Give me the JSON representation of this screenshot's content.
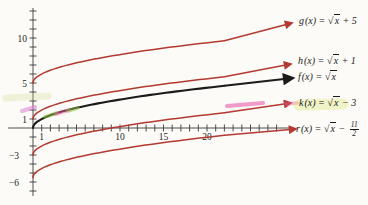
{
  "figure": {
    "background": "#fcfbf7",
    "axis_color": "#3a3a3a",
    "red_curve_color": "#b23a32",
    "black_curve_color": "#1b1b1b"
  },
  "chart_data": {
    "type": "line",
    "description_of_content": "Graphs of the square-root function and four vertical translations, each curve ending in an arrow pointing to its equation label",
    "grid": false,
    "x_axis": {
      "min": 0,
      "max": 28,
      "tick_interval": 1,
      "tick_label_values": [
        1,
        10,
        15,
        20
      ],
      "tick_labels": [
        "1",
        "10",
        "15",
        "20"
      ]
    },
    "y_axis": {
      "min": -7,
      "max": 13,
      "tick_interval": 1,
      "tick_label_values": [
        10,
        5,
        1,
        -3,
        -6
      ],
      "tick_labels": [
        "10",
        "5",
        "1",
        "−3",
        "−6"
      ]
    },
    "series": [
      {
        "name": "g",
        "expression": "g(x) = √x + 5",
        "vertical_shift": 5,
        "y_intercept": 5,
        "color": "#b23a32",
        "label_parts": {
          "name": "g",
          "mid": "(x) = ",
          "radicand": "x",
          "tail": " + 5"
        }
      },
      {
        "name": "h",
        "expression": "h(x) = √x + 1",
        "vertical_shift": 1,
        "y_intercept": 1,
        "color": "#b23a32",
        "label_parts": {
          "name": "h",
          "mid": "(x) = ",
          "radicand": "x",
          "tail": " + 1"
        }
      },
      {
        "name": "f",
        "expression": "f(x) = √x",
        "vertical_shift": 0,
        "y_intercept": 0,
        "color": "#1b1b1b",
        "label_parts": {
          "name": "f",
          "mid": "(x) = ",
          "radicand": "x",
          "tail": ""
        }
      },
      {
        "name": "k",
        "expression": "k(x) = √x − 3",
        "vertical_shift": -3,
        "y_intercept": -3,
        "color": "#b23a32",
        "label_parts": {
          "name": "k",
          "mid": "(x) = ",
          "radicand": "x",
          "tail": " − 3"
        }
      },
      {
        "name": "r",
        "expression": "r(x) = √x − 11/2",
        "vertical_shift": -5.5,
        "y_intercept": -5.5,
        "color": "#b23a32",
        "label_parts": {
          "name": "r",
          "mid": "(x) = ",
          "radicand": "x",
          "tail": " − ",
          "fraction": {
            "num": "11",
            "den": "2"
          }
        }
      }
    ]
  },
  "annotations": {
    "highlights": [
      {
        "name": "pink-dash-h-curve-start",
        "color": "#dd7fd3",
        "opacity": 0.55,
        "width": 4,
        "x1": 22,
        "y1": 111,
        "x2": 35,
        "y2": 107
      },
      {
        "name": "green-dash-f-curve",
        "color": "#8cc63f",
        "opacity": 0.55,
        "width": 3.5,
        "x1": 45,
        "y1": 117,
        "x2": 57,
        "y2": 113
      },
      {
        "name": "pink-dash-f-curve",
        "color": "#ef5fa7",
        "opacity": 0.5,
        "width": 3.5,
        "x1": 56,
        "y1": 114,
        "x2": 69,
        "y2": 110
      },
      {
        "name": "green-dash-f-curve-2",
        "color": "#8cc63f",
        "opacity": 0.5,
        "width": 3.5,
        "x1": 68,
        "y1": 111,
        "x2": 78,
        "y2": 108
      },
      {
        "name": "magenta-streak-k-curve",
        "color": "#e83e9c",
        "opacity": 0.5,
        "width": 4,
        "x1": 227,
        "y1": 106,
        "x2": 263,
        "y2": 103
      },
      {
        "name": "pink-dash-k-arrow",
        "color": "#ef5fa7",
        "opacity": 0.4,
        "width": 3.5,
        "x1": 286,
        "y1": 104,
        "x2": 297,
        "y2": 103
      },
      {
        "name": "green-wash-k-label",
        "color": "#cfe24a",
        "opacity": 0.28,
        "width": 11,
        "x1": 299,
        "y1": 105,
        "x2": 343,
        "y2": 104
      },
      {
        "name": "yellow-smudge-left-edge",
        "color": "#d8d98a",
        "opacity": 0.28,
        "width": 7,
        "x1": 6,
        "y1": 98,
        "x2": 48,
        "y2": 96
      }
    ]
  }
}
